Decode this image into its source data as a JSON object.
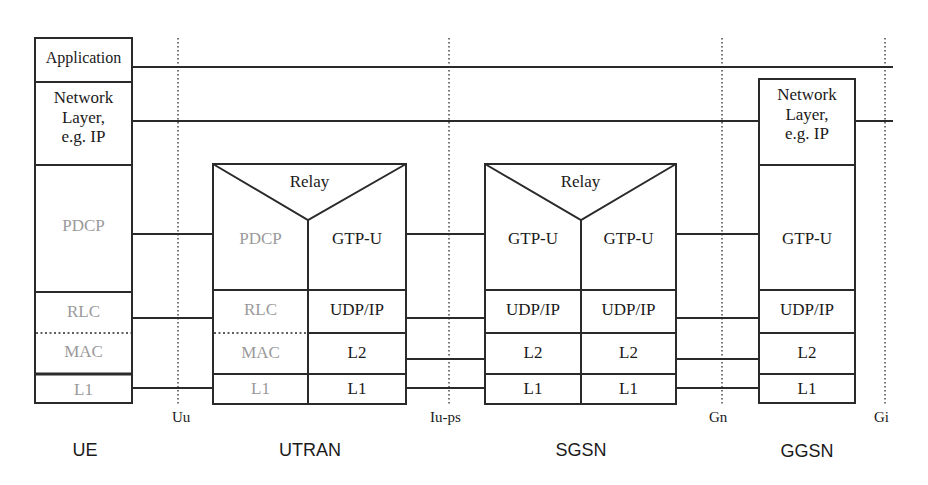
{
  "interfaces": [
    {
      "label": "Uu",
      "x": 178
    },
    {
      "label": "Iu-ps",
      "x": 449
    },
    {
      "label": "Gn",
      "x": 722
    },
    {
      "label": "Gi",
      "x": 885
    }
  ],
  "nodes": [
    {
      "id": "ue",
      "label": "UE"
    },
    {
      "id": "utran",
      "label": "UTRAN"
    },
    {
      "id": "sgsn",
      "label": "SGSN"
    },
    {
      "id": "ggsn",
      "label": "GGSN"
    }
  ],
  "ue": {
    "layers": [
      "Application",
      "Network Layer, e.g. IP",
      "PDCP",
      "RLC",
      "MAC",
      "L1"
    ],
    "application": "Application",
    "network_l1": "Network",
    "network_l2": "Layer,",
    "network_l3": "e.g. IP",
    "pdcp": "PDCP",
    "rlc": "RLC",
    "mac": "MAC",
    "l1": "L1"
  },
  "utran": {
    "relay": "Relay",
    "left": {
      "pdcp": "PDCP",
      "rlc": "RLC",
      "mac": "MAC",
      "l1": "L1"
    },
    "right": {
      "gtpu": "GTP-U",
      "udpip": "UDP/IP",
      "l2": "L2",
      "l1": "L1"
    }
  },
  "sgsn": {
    "relay": "Relay",
    "left": {
      "gtpu": "GTP-U",
      "udpip": "UDP/IP",
      "l2": "L2",
      "l1": "L1"
    },
    "right": {
      "gtpu": "GTP-U",
      "udpip": "UDP/IP",
      "l2": "L2",
      "l1": "L1"
    }
  },
  "ggsn": {
    "network_l1": "Network",
    "network_l2": "Layer,",
    "network_l3": "e.g. IP",
    "gtpu": "GTP-U",
    "udpip": "UDP/IP",
    "l2": "L2",
    "l1": "L1"
  },
  "colors": {
    "line": "#2a2a2a",
    "grey_text": "#9a9a9a",
    "text": "#1a1a1a"
  }
}
